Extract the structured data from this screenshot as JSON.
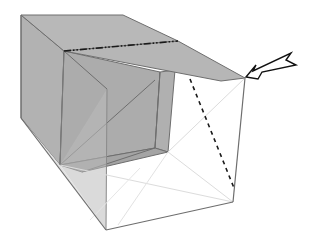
{
  "diagram": {
    "title": "",
    "colors": {
      "background": "#ffffff",
      "face_dark": "#a6a6a6",
      "face_mid": "#b4b4b4",
      "face_light": "#bdbdbd",
      "translucent_face": "#e4e4e4",
      "edge": "#6e6e6e",
      "hidden_edge": "#dcdcdc",
      "fold_line": "#1a1a1a",
      "arrow_fill": "#ffffff",
      "arrow_stroke": "#111111"
    },
    "annotations": {
      "mountain_fold": "dash-dot line across top flap",
      "valley_fold": "dashed line on right face",
      "arrow": "push/fold arrow pointing to right corner"
    }
  }
}
